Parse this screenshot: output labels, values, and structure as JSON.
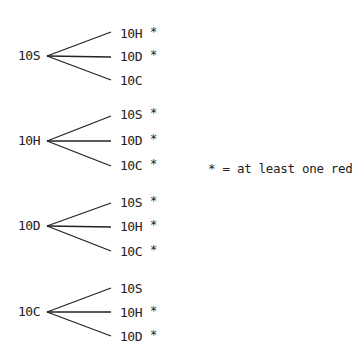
{
  "diagram": {
    "type": "tree",
    "legend": "* = at least one red",
    "groups": [
      {
        "root": "10S",
        "branches": [
          {
            "label": "10H",
            "star": "*"
          },
          {
            "label": "10D",
            "star": "*"
          },
          {
            "label": "10C",
            "star": ""
          }
        ]
      },
      {
        "root": "10H",
        "branches": [
          {
            "label": "10S",
            "star": "*"
          },
          {
            "label": "10D",
            "star": "*"
          },
          {
            "label": "10C",
            "star": "*"
          }
        ]
      },
      {
        "root": "10D",
        "branches": [
          {
            "label": "10S",
            "star": "*"
          },
          {
            "label": "10H",
            "star": "*"
          },
          {
            "label": "10C",
            "star": "*"
          }
        ]
      },
      {
        "root": "10C",
        "branches": [
          {
            "label": "10S",
            "star": ""
          },
          {
            "label": "10H",
            "star": "*"
          },
          {
            "label": "10D",
            "star": "*"
          }
        ]
      }
    ]
  }
}
